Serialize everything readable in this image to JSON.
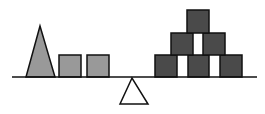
{
  "diagram": {
    "colors": {
      "background": "#ffffff",
      "stroke": "#111111",
      "light_fill": "#999999",
      "dark_fill": "#4a4a4a",
      "fulcrum_fill": "#ffffff"
    },
    "beam": {
      "x1": 12,
      "y1": 77,
      "x2": 257,
      "y2": 77
    },
    "fulcrum": {
      "points": "132,78 120,104 148,104"
    },
    "left_side": {
      "triangle": {
        "points": "40,26 26,77 55,77"
      },
      "squares": [
        {
          "x": 59,
          "y": 55,
          "w": 22,
          "h": 22
        },
        {
          "x": 87,
          "y": 55,
          "w": 22,
          "h": 22
        }
      ]
    },
    "right_side": {
      "blocks": [
        {
          "x": 155,
          "y": 55,
          "w": 22,
          "h": 22
        },
        {
          "x": 188,
          "y": 55,
          "w": 21,
          "h": 22
        },
        {
          "x": 220,
          "y": 55,
          "w": 22,
          "h": 22
        },
        {
          "x": 171,
          "y": 33,
          "w": 22,
          "h": 22
        },
        {
          "x": 203,
          "y": 33,
          "w": 22,
          "h": 22
        },
        {
          "x": 187,
          "y": 10,
          "w": 22,
          "h": 23
        }
      ]
    }
  }
}
